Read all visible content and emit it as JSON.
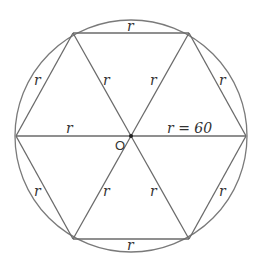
{
  "diagram": {
    "center_label": "O",
    "radius_value_label": "r = 60",
    "side_label": "r",
    "radius_label": "r",
    "labels": {
      "top_side": "r",
      "bottom_side": "r",
      "upper_left_side": "r",
      "upper_right_side": "r",
      "lower_left_side": "r",
      "lower_right_side": "r",
      "upper_left_radius": "r",
      "upper_right_radius": "r",
      "lower_left_radius": "r",
      "lower_right_radius": "r",
      "left_radius": "r",
      "right_radius": "r = 60"
    }
  }
}
